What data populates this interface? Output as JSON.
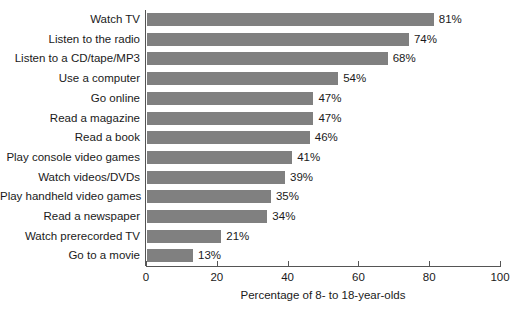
{
  "chart_data": {
    "type": "bar",
    "orientation": "horizontal",
    "title": "",
    "xlabel": "Percentage of 8- to 18-year-olds",
    "ylabel": "",
    "xlim": [
      0,
      100
    ],
    "xticks": [
      0,
      20,
      40,
      60,
      80,
      100
    ],
    "xtick_labels": [
      "0",
      "20",
      "40",
      "60",
      "80",
      "100"
    ],
    "grid": false,
    "legend": null,
    "bar_color": "#808080",
    "axis_color": "#555555",
    "text_color": "#1a1a1a",
    "value_label_suffix": "%",
    "categories": [
      "Watch TV",
      "Listen to the radio",
      "Listen to a CD/tape/MP3",
      "Use a computer",
      "Go online",
      "Read a magazine",
      "Read a book",
      "Play console video games",
      "Watch videos/DVDs",
      "Play handheld video games",
      "Read a newspaper",
      "Watch prerecorded TV",
      "Go to a movie"
    ],
    "values": [
      81,
      74,
      68,
      54,
      47,
      47,
      46,
      41,
      39,
      35,
      34,
      21,
      13
    ],
    "value_labels": [
      "81%",
      "74%",
      "68%",
      "54%",
      "47%",
      "47%",
      "46%",
      "41%",
      "39%",
      "35%",
      "34%",
      "21%",
      "13%"
    ]
  }
}
